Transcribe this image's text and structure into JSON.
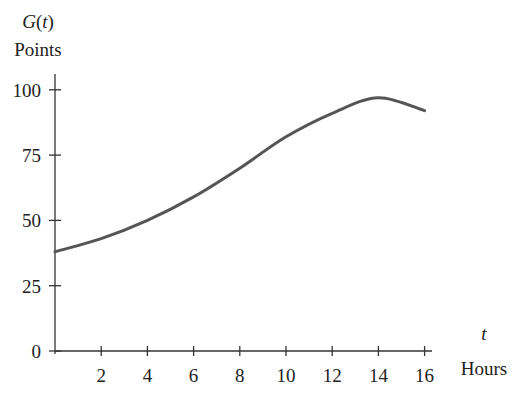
{
  "chart_data": {
    "type": "line",
    "title": "",
    "ylabel_function": "G(t)",
    "ylabel": "Points",
    "xlabel_var": "t",
    "xlabel": "Hours",
    "x": [
      0,
      2,
      4,
      6,
      8,
      10,
      12,
      14,
      16
    ],
    "series": [
      {
        "name": "G(t)",
        "values": [
          38,
          43,
          50,
          59,
          70,
          82,
          91,
          97,
          92
        ]
      }
    ],
    "xticks": [
      2,
      4,
      6,
      8,
      10,
      12,
      14,
      16
    ],
    "yticks": [
      0,
      25,
      50,
      75,
      100
    ],
    "xlim": [
      0,
      16
    ],
    "ylim": [
      0,
      100
    ],
    "grid": false,
    "legend": "none",
    "line_color": "#555555"
  }
}
